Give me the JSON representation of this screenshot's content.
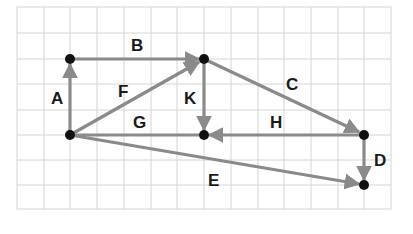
{
  "diagram": {
    "type": "vector-graph-on-grid",
    "grid": {
      "cols": 14,
      "rows": 8,
      "line_color": "#d4d4d4"
    },
    "points": [
      {
        "id": "p1",
        "col": 2,
        "row": 5
      },
      {
        "id": "p2",
        "col": 2,
        "row": 2
      },
      {
        "id": "p3",
        "col": 7,
        "row": 2
      },
      {
        "id": "p4",
        "col": 7,
        "row": 5
      },
      {
        "id": "p5",
        "col": 13,
        "row": 5
      },
      {
        "id": "p6",
        "col": 13,
        "row": 7
      }
    ],
    "vectors": [
      {
        "label": "A",
        "from": "p1",
        "to": "p2"
      },
      {
        "label": "B",
        "from": "p2",
        "to": "p3"
      },
      {
        "label": "C",
        "from": "p3",
        "to": "p5"
      },
      {
        "label": "D",
        "from": "p5",
        "to": "p6"
      },
      {
        "label": "E",
        "from": "p1",
        "to": "p6"
      },
      {
        "label": "F",
        "from": "p1",
        "to": "p3"
      },
      {
        "label": "G",
        "from": "p1",
        "to": "p4"
      },
      {
        "label": "H",
        "from": "p5",
        "to": "p4"
      },
      {
        "label": "K",
        "from": "p3",
        "to": "p4"
      }
    ],
    "colors": {
      "arrow": "#8a8a8a",
      "point": "#111111",
      "label": "#1a1a1a"
    }
  },
  "labels": {
    "A": "A",
    "B": "B",
    "C": "C",
    "D": "D",
    "E": "E",
    "F": "F",
    "G": "G",
    "H": "H",
    "K": "K"
  }
}
